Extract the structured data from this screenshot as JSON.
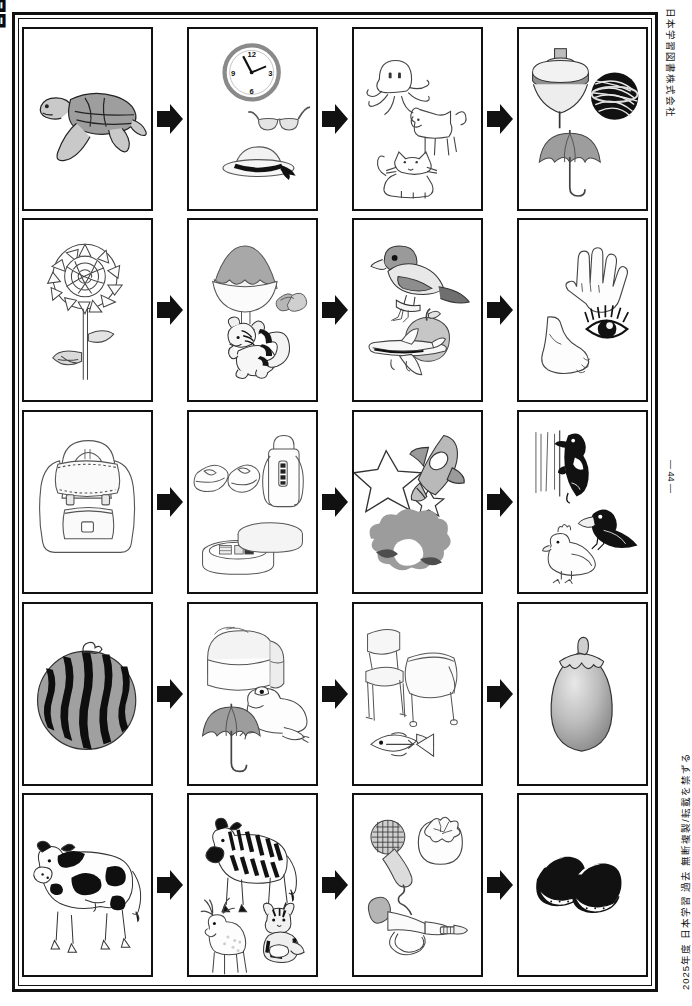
{
  "page": {
    "publisher": "日本学習図書株式会社",
    "page_number": "— 44 —",
    "copyright": "2025年度 日本学習 過去 無断複製/転載を禁ずる",
    "corner_mark": "問題",
    "frame_color": "#111111",
    "background_color": "#ffffff"
  },
  "worksheet": {
    "rows": [
      {
        "index": 1,
        "cells": [
          {
            "position": 1,
            "items": [
              "sea-turtle"
            ]
          },
          {
            "position": 2,
            "items": [
              "wall-clock",
              "eyeglasses",
              "sun-hat"
            ]
          },
          {
            "position": 3,
            "items": [
              "octopus",
              "dog",
              "cat"
            ]
          },
          {
            "position": 4,
            "items": [
              "spinning-top",
              "temari-ball",
              "umbrella"
            ]
          }
        ],
        "arrows": [
          "arrow-right",
          "arrow-right",
          "arrow-right"
        ]
      },
      {
        "index": 2,
        "cells": [
          {
            "position": 1,
            "items": [
              "sunflower"
            ]
          },
          {
            "position": 2,
            "items": [
              "shaved-ice",
              "acorns",
              "squirrel"
            ]
          },
          {
            "position": 3,
            "items": [
              "sparrow",
              "apple",
              "airplane"
            ]
          },
          {
            "position": 4,
            "items": [
              "hand",
              "eye",
              "foot"
            ]
          }
        ],
        "arrows": [
          "arrow-right",
          "arrow-right",
          "arrow-right"
        ]
      },
      {
        "index": 3,
        "cells": [
          {
            "position": 1,
            "items": [
              "backpack"
            ]
          },
          {
            "position": 2,
            "items": [
              "shoes",
              "water-bottle",
              "lunch-box"
            ]
          },
          {
            "position": 3,
            "items": [
              "star-big",
              "star-small",
              "rocket",
              "moon-clouds"
            ]
          },
          {
            "position": 4,
            "items": [
              "woodpecker",
              "crow",
              "chicken"
            ]
          }
        ],
        "arrows": [
          "arrow-right",
          "arrow-right",
          "arrow-right"
        ]
      },
      {
        "index": 4,
        "cells": [
          {
            "position": 1,
            "items": [
              "watermelon"
            ]
          },
          {
            "position": 2,
            "items": [
              "bread-loaf",
              "frog",
              "umbrella"
            ]
          },
          {
            "position": 3,
            "items": [
              "chair",
              "desk",
              "fish"
            ]
          },
          {
            "position": 4,
            "items": [
              "eggplant"
            ]
          }
        ],
        "arrows": [
          "arrow-right",
          "arrow-right",
          "arrow-right"
        ]
      },
      {
        "index": 5,
        "cells": [
          {
            "position": 1,
            "items": [
              "cow"
            ]
          },
          {
            "position": 2,
            "items": [
              "zebra",
              "deer",
              "tiger"
            ]
          },
          {
            "position": 3,
            "items": [
              "microphone",
              "persimmon",
              "trumpet"
            ]
          },
          {
            "position": 4,
            "items": [
              "chestnuts"
            ]
          }
        ],
        "arrows": [
          "arrow-right",
          "arrow-right",
          "arrow-right"
        ]
      }
    ],
    "clock": {
      "hour_labels": [
        "12",
        "3",
        "6",
        "9"
      ]
    }
  }
}
